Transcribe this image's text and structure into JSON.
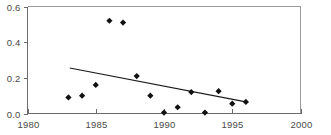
{
  "chart_data": {
    "type": "scatter",
    "title": "",
    "subtitle": "",
    "xlabel": "",
    "ylabel": "",
    "xlim": [
      1980,
      2000
    ],
    "ylim": [
      0.0,
      0.6
    ],
    "xticks": [
      1980,
      1985,
      1990,
      1995,
      2000
    ],
    "xtick_labels": [
      "1980",
      "1985",
      "1990",
      "1995",
      "2000"
    ],
    "yticks": [
      0.0,
      0.2,
      0.4,
      0.6
    ],
    "ytick_labels": [
      "0.0",
      "0.2",
      "0.4",
      "0.6"
    ],
    "grid": false,
    "legend": null,
    "legend_position": "none",
    "marker_style": "diamond",
    "marker_color": "#111111",
    "line_color": "#1a1a1a",
    "frame_color": "#9a9a9a",
    "axis_color": "#6b6b6b",
    "series": [
      {
        "name": "observations",
        "type": "scatter",
        "x": [
          1983,
          1984,
          1985,
          1986,
          1987,
          1988,
          1989,
          1990,
          1991,
          1992,
          1993,
          1994,
          1995,
          1996
        ],
        "y": [
          0.09,
          0.1,
          0.16,
          0.52,
          0.51,
          0.21,
          0.1,
          0.005,
          0.035,
          0.12,
          0.005,
          0.125,
          0.055,
          0.065
        ]
      },
      {
        "name": "trend",
        "type": "line",
        "x": [
          1983.1,
          1996.0
        ],
        "y": [
          0.255,
          0.065
        ]
      }
    ],
    "annotations": []
  },
  "axes": {
    "y_axis_name": "y-axis",
    "x_axis_name": "x-axis"
  }
}
